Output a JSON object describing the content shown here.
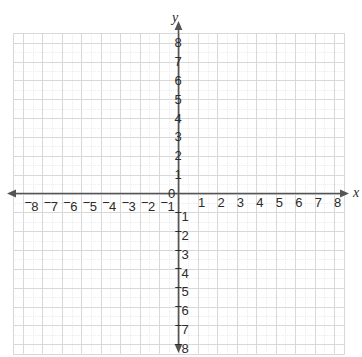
{
  "chart_data": {
    "type": "scatter",
    "title": "",
    "xlabel": "x",
    "ylabel": "y",
    "xlim": [
      -8.5,
      8.5
    ],
    "ylim": [
      -8.5,
      8.5
    ],
    "grid": true,
    "minor_grid": true,
    "minor_grid_divisions": 2,
    "legend": "none",
    "series": [],
    "values": [],
    "x": [],
    "origin_label": "0",
    "x_tick_values": [
      -8,
      -7,
      -6,
      -5,
      -4,
      -3,
      -2,
      -1,
      1,
      2,
      3,
      4,
      5,
      6,
      7,
      8
    ],
    "y_tick_values": [
      8,
      7,
      6,
      5,
      4,
      3,
      2,
      1,
      -1,
      -2,
      -3,
      -4,
      -5,
      -6,
      -7,
      -8
    ],
    "x_tick_labels": [
      "⁻8",
      "⁻7",
      "⁻6",
      "⁻5",
      "⁻4",
      "⁻3",
      "⁻2",
      "⁻1",
      "1",
      "2",
      "3",
      "4",
      "5",
      "6",
      "7",
      "8"
    ],
    "y_tick_labels": [
      "8",
      "7",
      "6",
      "5",
      "4",
      "3",
      "2",
      "1",
      "⁻1",
      "⁻2",
      "⁻3",
      "⁻4",
      "⁻5",
      "⁻6",
      "⁻7",
      "⁻8"
    ],
    "axis_arrows": [
      "left",
      "right",
      "up",
      "down"
    ],
    "colors": {
      "axis": "#555555",
      "grid_major": "#d8d8d8",
      "grid_minor": "#ebebeb",
      "label_text": "#2b2b2b",
      "background": "#ffffff"
    }
  },
  "axes": {
    "x_label": "x",
    "y_label": "y"
  },
  "x_ticks": [
    {
      "label": "8",
      "sign": "−",
      "value": -8
    },
    {
      "label": "7",
      "sign": "−",
      "value": -7
    },
    {
      "label": "6",
      "sign": "−",
      "value": -6
    },
    {
      "label": "5",
      "sign": "−",
      "value": -5
    },
    {
      "label": "4",
      "sign": "−",
      "value": -4
    },
    {
      "label": "3",
      "sign": "−",
      "value": -3
    },
    {
      "label": "2",
      "sign": "−",
      "value": -2
    },
    {
      "label": "1",
      "sign": "−",
      "value": -1
    },
    {
      "label": "1",
      "sign": "",
      "value": 1
    },
    {
      "label": "2",
      "sign": "",
      "value": 2
    },
    {
      "label": "3",
      "sign": "",
      "value": 3
    },
    {
      "label": "4",
      "sign": "",
      "value": 4
    },
    {
      "label": "5",
      "sign": "",
      "value": 5
    },
    {
      "label": "6",
      "sign": "",
      "value": 6
    },
    {
      "label": "7",
      "sign": "",
      "value": 7
    },
    {
      "label": "8",
      "sign": "",
      "value": 8
    }
  ],
  "y_ticks": [
    {
      "label": "8",
      "sign": "",
      "value": 8
    },
    {
      "label": "7",
      "sign": "",
      "value": 7
    },
    {
      "label": "6",
      "sign": "",
      "value": 6
    },
    {
      "label": "5",
      "sign": "",
      "value": 5
    },
    {
      "label": "4",
      "sign": "",
      "value": 4
    },
    {
      "label": "3",
      "sign": "",
      "value": 3
    },
    {
      "label": "2",
      "sign": "",
      "value": 2
    },
    {
      "label": "1",
      "sign": "",
      "value": 1
    },
    {
      "label": "1",
      "sign": "−",
      "value": -1
    },
    {
      "label": "2",
      "sign": "−",
      "value": -2
    },
    {
      "label": "3",
      "sign": "−",
      "value": -3
    },
    {
      "label": "4",
      "sign": "−",
      "value": -4
    },
    {
      "label": "5",
      "sign": "−",
      "value": -5
    },
    {
      "label": "6",
      "sign": "−",
      "value": -6
    },
    {
      "label": "7",
      "sign": "−",
      "value": -7
    },
    {
      "label": "8",
      "sign": "−",
      "value": -8
    }
  ],
  "origin": {
    "label": "0"
  }
}
